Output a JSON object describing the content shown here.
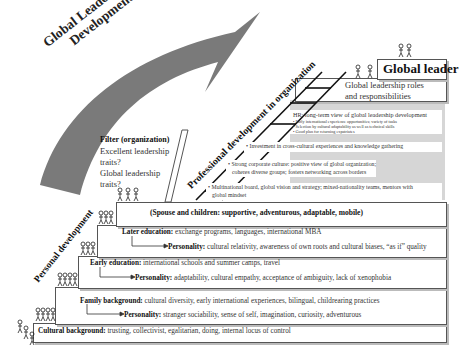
{
  "title": {
    "line1": "Global Leadership",
    "line2": "Development"
  },
  "global_leader": {
    "label": "Global leader",
    "roles_line1": "Global leadership roles",
    "roles_line2": "and responsibilities"
  },
  "filter": {
    "title": "Filter (organization)",
    "q1_line1": "Excellent leadership",
    "q1_line2": "traits?",
    "q2_line1": "Global leadership",
    "q2_line2": "traits?"
  },
  "professional": {
    "label": "Professional development in organization",
    "hr_title": "HR: long-term view of global leadership development",
    "hr_bullets": [
      "• Early international experience opportunities; variety of tasks",
      "• Selection by cultural adaptability as well as technical skills",
      "• Good plan for returning expatriates"
    ],
    "investment": "• Investment in cross-cultural experiences and knowledge gathering",
    "culture_line1": "• Strong corporate culture: positive view of global organization;",
    "culture_line2": "coheres diverse groups; fosters networking across borders",
    "board_line1": "• Multinational board, global vision and strategy; mixed-nationality teams, mentors with",
    "board_line2": "global mindset"
  },
  "personal": {
    "label": "Personal development",
    "spouse": "(Spouse and children: supportive, adventurous, adaptable, mobile)",
    "later_education": {
      "label": "Later education:",
      "text": " exchange programs, languages, international MBA"
    },
    "later_personality": {
      "label": "Personality:",
      "text": " cultural relativity, awareness of own roots and cultural biases, “as if” quality"
    },
    "early_education": {
      "label": "Early education:",
      "text": " international schools and summer camps, travel"
    },
    "early_personality": {
      "label": "Personality:",
      "text": " adaptability, cultural empathy, acceptance of ambiguity, lack of xenophobia"
    },
    "family": {
      "label": "Family background:",
      "text": " cultural diversity, early international experiences, bilingual, childrearing practices"
    },
    "family_personality": {
      "label": "Personality:",
      "text": " stranger sociability, sense of self, imagination, curiosity, adventurous"
    },
    "cultural": {
      "label": "Cultural background:",
      "text": " trusting, collectivist, egalitarian, doing, internal locus of control"
    }
  }
}
